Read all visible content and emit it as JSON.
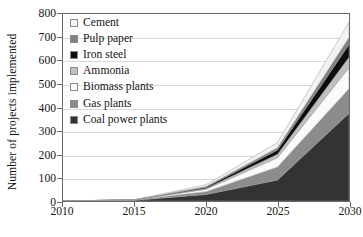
{
  "chart_data": {
    "type": "area",
    "stacked": true,
    "title": "",
    "xlabel": "",
    "ylabel": "Number of projects implemented",
    "x": [
      2010,
      2015,
      2020,
      2025,
      2030
    ],
    "xlim": [
      2010,
      2030
    ],
    "ylim": [
      0,
      800
    ],
    "xticks": [
      "2010",
      "2015",
      "2020",
      "2025",
      "2030"
    ],
    "yticks": [
      "0",
      "100",
      "200",
      "300",
      "400",
      "500",
      "600",
      "700",
      "800"
    ],
    "ytick_values": [
      0,
      100,
      200,
      300,
      400,
      500,
      600,
      700,
      800
    ],
    "grid": true,
    "grid_axis": "y",
    "legend_position": "upper-left-inside",
    "stack_order_bottom_to_top": [
      "Coal power plants",
      "Gas plants",
      "Biomass plants",
      "Ammonia",
      "Iron steel",
      "Pulp paper",
      "Cement"
    ],
    "series": [
      {
        "name": "Cement",
        "color": "#f2f2f2",
        "values": [
          0,
          0,
          8,
          22,
          65
        ]
      },
      {
        "name": "Pulp paper",
        "color": "#808080",
        "values": [
          0,
          0,
          3,
          10,
          30
        ]
      },
      {
        "name": "Iron steel",
        "color": "#0d0d0d",
        "values": [
          0,
          0,
          5,
          18,
          55
        ]
      },
      {
        "name": "Ammonia",
        "color": "#bfbfbf",
        "values": [
          0,
          0,
          4,
          15,
          45
        ]
      },
      {
        "name": "Biomass plants",
        "color": "#fafafa",
        "values": [
          0,
          1,
          10,
          40,
          90
        ]
      },
      {
        "name": "Gas plants",
        "color": "#8c8c8c",
        "values": [
          0,
          1,
          12,
          55,
          105
        ]
      },
      {
        "name": "Coal power plants",
        "color": "#333333",
        "values": [
          0,
          3,
          28,
          90,
          375
        ]
      }
    ],
    "totals": [
      0,
      5,
      70,
      250,
      765
    ]
  },
  "legend": {
    "items": [
      {
        "label": "Cement",
        "swatch": "legend-swatch-cement",
        "color": "#f2f2f2"
      },
      {
        "label": "Pulp paper",
        "swatch": "legend-swatch-pulp-paper",
        "color": "#808080"
      },
      {
        "label": "Iron steel",
        "swatch": "legend-swatch-iron-steel",
        "color": "#0d0d0d"
      },
      {
        "label": "Ammonia",
        "swatch": "legend-swatch-ammonia",
        "color": "#bfbfbf"
      },
      {
        "label": "Biomass plants",
        "swatch": "legend-swatch-biomass",
        "color": "#fafafa"
      },
      {
        "label": "Gas plants",
        "swatch": "legend-swatch-gas",
        "color": "#8c8c8c"
      },
      {
        "label": "Coal power plants",
        "swatch": "legend-swatch-coal",
        "color": "#333333"
      }
    ]
  },
  "axes": {
    "y_title": "Number of projects implemented",
    "y_labels": [
      "800",
      "700",
      "600",
      "500",
      "400",
      "300",
      "200",
      "100",
      "0"
    ],
    "x_labels": [
      "2010",
      "2015",
      "2020",
      "2025",
      "2030"
    ]
  },
  "colors": {
    "frame": "#6a6a6a",
    "grid": "#d8d8d8",
    "text": "#151515",
    "background": "#ffffff",
    "area_outline": "#9a9a9a"
  }
}
